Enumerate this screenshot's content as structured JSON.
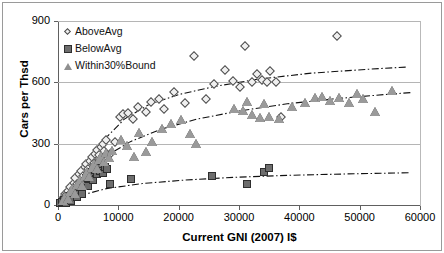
{
  "chart_data": {
    "type": "scatter",
    "title": "",
    "xlabel": "Current GNI (2007) I$",
    "ylabel": "Cars per Thsd",
    "xlim": [
      0,
      60000
    ],
    "ylim": [
      0,
      900
    ],
    "xticks": [
      0,
      10000,
      20000,
      30000,
      40000,
      50000,
      60000
    ],
    "yticks": [
      0,
      300,
      600,
      900
    ],
    "xtick_labels": [
      "0",
      "10000",
      "20000",
      "30000",
      "40000",
      "50000",
      "60000"
    ],
    "ytick_labels": [
      "0",
      "300",
      "600",
      "900"
    ],
    "grid": "horizontal",
    "legend_position": "top-left",
    "series": [
      {
        "name": "AboveAvg",
        "marker": "diamond",
        "color": "#f0f0f0",
        "edge_color": "#4a4a4a",
        "points": [
          [
            600,
            20
          ],
          [
            900,
            35
          ],
          [
            1100,
            55
          ],
          [
            1400,
            48
          ],
          [
            1700,
            70
          ],
          [
            2000,
            90
          ],
          [
            2300,
            62
          ],
          [
            2600,
            110
          ],
          [
            2900,
            130
          ],
          [
            3200,
            105
          ],
          [
            3500,
            150
          ],
          [
            3800,
            165
          ],
          [
            4100,
            140
          ],
          [
            4400,
            185
          ],
          [
            4700,
            200
          ],
          [
            5000,
            175
          ],
          [
            5300,
            215
          ],
          [
            5600,
            235
          ],
          [
            5900,
            205
          ],
          [
            6200,
            250
          ],
          [
            6500,
            270
          ],
          [
            6800,
            245
          ],
          [
            7100,
            285
          ],
          [
            7400,
            300
          ],
          [
            7700,
            265
          ],
          [
            8000,
            320
          ],
          [
            8600,
            250
          ],
          [
            9500,
            310
          ],
          [
            10200,
            430
          ],
          [
            10800,
            445
          ],
          [
            11600,
            450
          ],
          [
            12400,
            420
          ],
          [
            13200,
            480
          ],
          [
            14600,
            455
          ],
          [
            15400,
            505
          ],
          [
            16800,
            520
          ],
          [
            17600,
            470
          ],
          [
            19200,
            555
          ],
          [
            21000,
            500
          ],
          [
            22600,
            730
          ],
          [
            24600,
            520
          ],
          [
            25800,
            590
          ],
          [
            27600,
            660
          ],
          [
            29000,
            605
          ],
          [
            30200,
            575
          ],
          [
            31000,
            780
          ],
          [
            32200,
            600
          ],
          [
            33000,
            640
          ],
          [
            33800,
            610
          ],
          [
            34600,
            600
          ],
          [
            35200,
            655
          ],
          [
            36200,
            600
          ],
          [
            37000,
            430
          ],
          [
            46200,
            825
          ]
        ]
      },
      {
        "name": "BelowAvg",
        "marker": "square",
        "color": "#6d6d6d",
        "edge_color": "#2e2e2e",
        "points": [
          [
            400,
            10
          ],
          [
            700,
            15
          ],
          [
            1000,
            25
          ],
          [
            1300,
            12
          ],
          [
            1600,
            35
          ],
          [
            1900,
            45
          ],
          [
            2200,
            20
          ],
          [
            2500,
            60
          ],
          [
            2800,
            75
          ],
          [
            3100,
            40
          ],
          [
            3400,
            90
          ],
          [
            3700,
            100
          ],
          [
            4000,
            55
          ],
          [
            4300,
            115
          ],
          [
            4600,
            130
          ],
          [
            4900,
            95
          ],
          [
            5200,
            145
          ],
          [
            5500,
            160
          ],
          [
            5800,
            120
          ],
          [
            6100,
            170
          ],
          [
            6400,
            150
          ],
          [
            6700,
            180
          ],
          [
            7000,
            165
          ],
          [
            7400,
            155
          ],
          [
            7800,
            185
          ],
          [
            8200,
            175
          ],
          [
            8600,
            105
          ],
          [
            12100,
            125
          ],
          [
            25600,
            140
          ],
          [
            31400,
            105
          ],
          [
            34100,
            160
          ],
          [
            34900,
            180
          ]
        ]
      },
      {
        "name": "Within30%Bound",
        "marker": "triangle",
        "color": "#9a9a9a",
        "edge_color": "#555555",
        "points": [
          [
            800,
            18
          ],
          [
            1200,
            40
          ],
          [
            1600,
            30
          ],
          [
            2000,
            65
          ],
          [
            2400,
            80
          ],
          [
            2800,
            55
          ],
          [
            3200,
            100
          ],
          [
            3600,
            120
          ],
          [
            4000,
            95
          ],
          [
            4400,
            140
          ],
          [
            4800,
            160
          ],
          [
            5200,
            135
          ],
          [
            5600,
            180
          ],
          [
            6000,
            200
          ],
          [
            6400,
            175
          ],
          [
            6800,
            220
          ],
          [
            7200,
            240
          ],
          [
            7600,
            210
          ],
          [
            8000,
            255
          ],
          [
            8400,
            230
          ],
          [
            9000,
            265
          ],
          [
            10400,
            320
          ],
          [
            11400,
            290
          ],
          [
            12600,
            235
          ],
          [
            13400,
            350
          ],
          [
            14600,
            260
          ],
          [
            15600,
            310
          ],
          [
            17200,
            370
          ],
          [
            18800,
            395
          ],
          [
            20400,
            415
          ],
          [
            21800,
            345
          ],
          [
            22800,
            300
          ],
          [
            29200,
            470
          ],
          [
            30600,
            460
          ],
          [
            31400,
            505
          ],
          [
            32200,
            440
          ],
          [
            33400,
            425
          ],
          [
            34200,
            495
          ],
          [
            35000,
            430
          ],
          [
            36600,
            420
          ],
          [
            38800,
            480
          ],
          [
            41000,
            500
          ],
          [
            42600,
            525
          ],
          [
            43800,
            530
          ],
          [
            45000,
            510
          ],
          [
            46600,
            525
          ],
          [
            48200,
            500
          ],
          [
            49600,
            545
          ],
          [
            50600,
            520
          ],
          [
            52600,
            455
          ],
          [
            55400,
            560
          ]
        ]
      }
    ],
    "trendlines": [
      {
        "name": "AboveAvg-trend",
        "style": "dash-dot",
        "points": [
          [
            5800,
            200
          ],
          [
            8000,
            330
          ],
          [
            11000,
            420
          ],
          [
            15000,
            490
          ],
          [
            20000,
            540
          ],
          [
            26000,
            580
          ],
          [
            33000,
            615
          ],
          [
            42000,
            645
          ],
          [
            52000,
            665
          ],
          [
            58000,
            675
          ]
        ]
      },
      {
        "name": "Within30%Bound-trend",
        "style": "dash-dot",
        "points": [
          [
            4500,
            130
          ],
          [
            8000,
            240
          ],
          [
            12000,
            310
          ],
          [
            17000,
            370
          ],
          [
            23000,
            420
          ],
          [
            30000,
            460
          ],
          [
            38000,
            495
          ],
          [
            46000,
            520
          ],
          [
            54000,
            540
          ],
          [
            58500,
            550
          ]
        ]
      },
      {
        "name": "BelowAvg-trend",
        "style": "dash-dot",
        "points": [
          [
            3500,
            45
          ],
          [
            8000,
            80
          ],
          [
            14000,
            105
          ],
          [
            21000,
            122
          ],
          [
            29000,
            135
          ],
          [
            38000,
            145
          ],
          [
            48000,
            152
          ],
          [
            58500,
            158
          ]
        ]
      }
    ]
  },
  "legend": {
    "items": [
      {
        "label": "AboveAvg",
        "marker": "diamond"
      },
      {
        "label": "BelowAvg",
        "marker": "square"
      },
      {
        "label": "Within30%Bound",
        "marker": "triangle"
      }
    ]
  },
  "axes": {
    "y_title": "Cars per Thsd",
    "x_title": "Current GNI (2007) I$"
  }
}
